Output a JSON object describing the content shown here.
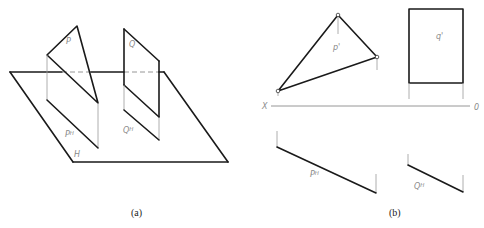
{
  "figure": {
    "panel_a": {
      "caption": "(a)",
      "labels": {
        "plane_p": "P",
        "plane_q": "Q",
        "trace_p_base": "P",
        "trace_p_sup": "H",
        "trace_q_base": "Q",
        "trace_q_sup": "H",
        "plane_h": "H"
      }
    },
    "panel_b": {
      "caption": "(b)",
      "labels": {
        "p_prime": "p'",
        "q_prime": "q'",
        "axis_left": "X",
        "axis_right": "0",
        "trace_p_base": "P",
        "trace_p_sup": "H",
        "trace_q_base": "Q",
        "trace_q_sup": "H"
      }
    },
    "colors": {
      "line": "#1a1a1a",
      "thin_line": "#9a9a9a",
      "label": "#8a8a8a"
    }
  }
}
